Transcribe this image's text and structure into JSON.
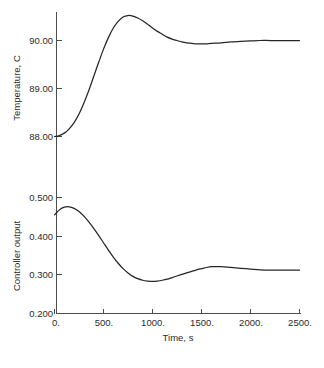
{
  "chart_data": {
    "type": "line",
    "title": "",
    "xlabel": "Time, s",
    "x": [
      0,
      50,
      100,
      150,
      200,
      250,
      300,
      350,
      400,
      450,
      500,
      550,
      600,
      650,
      700,
      750,
      800,
      850,
      900,
      950,
      1000,
      1050,
      1100,
      1150,
      1200,
      1250,
      1300,
      1350,
      1400,
      1450,
      1500,
      1550,
      1600,
      1700,
      1800,
      1900,
      2000,
      2100,
      2200,
      2300,
      2400,
      2500
    ],
    "xlim": [
      0,
      2500
    ],
    "xticks": [
      0,
      500,
      1000,
      1500,
      2000,
      2500
    ],
    "xticklabels": [
      "0.",
      "500.",
      "1000.",
      "1500.",
      "2000.",
      "2500."
    ],
    "grid": false,
    "legend": "none",
    "panels": [
      {
        "name": "temperature-panel",
        "ylabel": "Temperature, C",
        "ylim": [
          87.75,
          90.75
        ],
        "yticks": [
          88.0,
          89.0,
          90.0
        ],
        "yticklabels": [
          "88.00",
          "89.00",
          "90.00"
        ],
        "series": [
          {
            "name": "Temperature",
            "values": [
              88.0,
              88.02,
              88.07,
              88.16,
              88.29,
              88.47,
              88.7,
              88.96,
              89.25,
              89.54,
              89.82,
              90.06,
              90.26,
              90.4,
              90.49,
              90.52,
              90.51,
              90.47,
              90.41,
              90.34,
              90.26,
              90.19,
              90.13,
              90.07,
              90.03,
              90.0,
              89.97,
              89.95,
              89.94,
              89.93,
              89.93,
              89.93,
              89.94,
              89.95,
              89.97,
              89.98,
              89.99,
              90.0,
              90.0,
              90.0,
              90.0,
              90.0
            ]
          }
        ]
      },
      {
        "name": "controller-output-panel",
        "ylabel": "Controller output",
        "ylim": [
          0.2,
          0.52
        ],
        "yticks": [
          0.2,
          0.3,
          0.4,
          0.5
        ],
        "yticklabels": [
          "0.200",
          "0.300",
          "0.400",
          "0.500"
        ],
        "series": [
          {
            "name": "Controller output",
            "values": [
              0.455,
              0.468,
              0.475,
              0.476,
              0.472,
              0.464,
              0.452,
              0.437,
              0.42,
              0.402,
              0.383,
              0.364,
              0.346,
              0.33,
              0.316,
              0.305,
              0.296,
              0.29,
              0.286,
              0.284,
              0.283,
              0.284,
              0.286,
              0.289,
              0.293,
              0.297,
              0.301,
              0.305,
              0.309,
              0.313,
              0.316,
              0.319,
              0.321,
              0.321,
              0.319,
              0.317,
              0.315,
              0.313,
              0.312,
              0.312,
              0.312,
              0.312
            ]
          }
        ]
      }
    ]
  }
}
